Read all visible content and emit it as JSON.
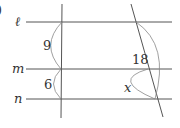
{
  "diagram": {
    "type": "parallel-lines-transversals",
    "partial_label": ")",
    "lines": [
      {
        "name": "l",
        "label": "ℓ"
      },
      {
        "name": "m",
        "label": "m"
      },
      {
        "name": "n",
        "label": "n"
      }
    ],
    "segments": {
      "vertical_l_to_m": "9",
      "vertical_m_to_n": "6",
      "diagonal_l_to_n": "18",
      "diagonal_m_to_n": "x"
    },
    "colors": {
      "line": "#555555",
      "text": "#333333",
      "arc": "#888888"
    }
  }
}
